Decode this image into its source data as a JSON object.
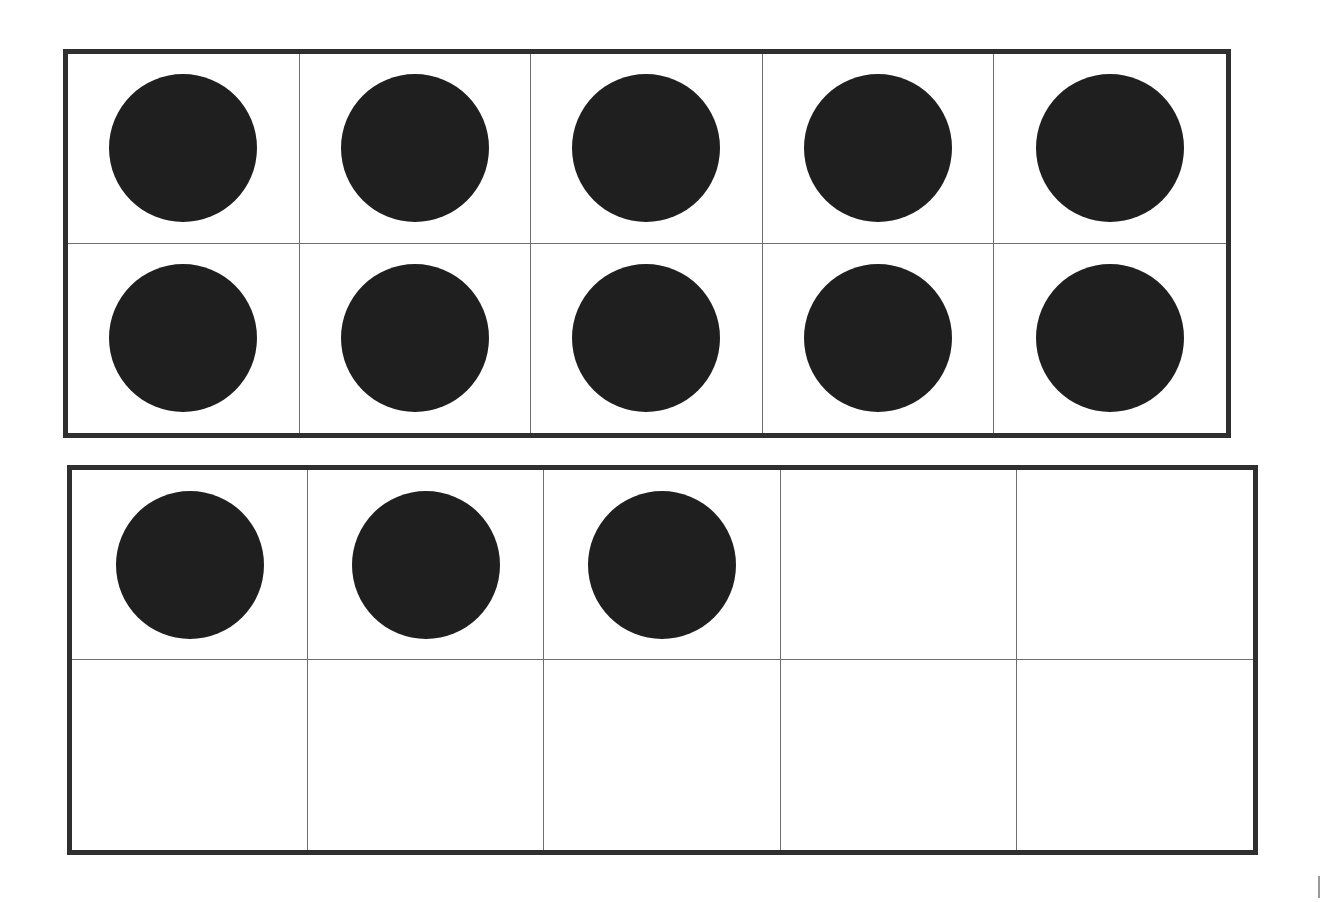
{
  "diagram": {
    "type": "ten-frames",
    "colors": {
      "border": "#2f2f2f",
      "grid": "#6e6e6e",
      "dot": "#1f1f1f",
      "background": "#ffffff"
    },
    "frames": [
      {
        "name": "top-ten-frame",
        "rows": 2,
        "columns": 5,
        "filled_count": 10,
        "cells": [
          1,
          1,
          1,
          1,
          1,
          1,
          1,
          1,
          1,
          1
        ]
      },
      {
        "name": "bottom-ten-frame",
        "rows": 2,
        "columns": 5,
        "filled_count": 3,
        "cells": [
          1,
          1,
          1,
          0,
          0,
          0,
          0,
          0,
          0,
          0
        ]
      }
    ],
    "total_dots": 13
  }
}
